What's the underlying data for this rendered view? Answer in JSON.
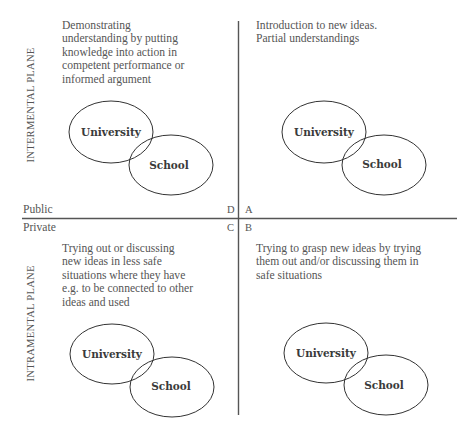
{
  "axes": {
    "horizontal_top_label": "Public",
    "horizontal_bottom_label": "Private",
    "vertical_top_label": "INTERMENTAL PLANE",
    "vertical_bottom_label": "INTRAMENTAL PLANE"
  },
  "quadrants": [
    {
      "letter": "A",
      "position": "top-right",
      "description": "Introduction to new ideas.\nPartial understandings",
      "circles": {
        "large": "University",
        "small": "School"
      }
    },
    {
      "letter": "B",
      "position": "bottom-right",
      "description": "Trying to grasp new ideas by trying\nthem out and/or discussing them in\nsafe situations",
      "circles": {
        "large": "University",
        "small": "School"
      }
    },
    {
      "letter": "C",
      "position": "bottom-left",
      "description": "Trying out or discussing\nnew ideas in less safe\nsituations where they have\ne.g. to be connected to other\nideas and used",
      "circles": {
        "large": "University",
        "small": "School"
      }
    },
    {
      "letter": "D",
      "position": "top-left",
      "description": "Demonstrating\nunderstanding by putting\nknowledge into action in\ncompetent performance or\ninformed argument",
      "circles": {
        "large": "University",
        "small": "School"
      }
    }
  ],
  "colors": {
    "line": "#555555",
    "text": "#555555",
    "circle_label": "#3a3a3a"
  }
}
